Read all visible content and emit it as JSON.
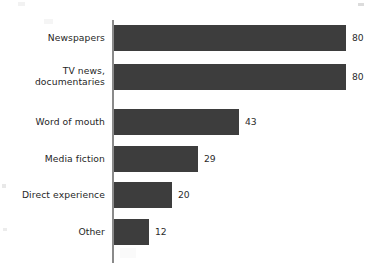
{
  "chart_data": {
    "type": "bar",
    "orientation": "horizontal",
    "title": "",
    "subtitle": "",
    "xlabel": "",
    "ylabel": "",
    "categories": [
      "Newspapers",
      "TV news,\ndocumentaries",
      "Word of mouth",
      "Media fiction",
      "Direct experience",
      "Other"
    ],
    "values": [
      80,
      80,
      43,
      29,
      20,
      12
    ],
    "value_labels": [
      "80",
      "80",
      "43",
      "29",
      "20",
      "12"
    ],
    "xlim": [
      0,
      80
    ],
    "grid": false,
    "legend": false,
    "bar_color": "#3d3d3d",
    "axis_color": "#8a8a8a",
    "background_color": "#ffffff",
    "label_color": "#262626",
    "bars": [
      {
        "label": "Newspapers",
        "value": 80,
        "value_label": "80",
        "lines": 1
      },
      {
        "label": "TV news,\ndocumentaries",
        "value": 80,
        "value_label": "80",
        "lines": 2
      },
      {
        "label": "Word of mouth",
        "value": 43,
        "value_label": "43",
        "lines": 1
      },
      {
        "label": "Media fiction",
        "value": 29,
        "value_label": "29",
        "lines": 1
      },
      {
        "label": "Direct experience",
        "value": 20,
        "value_label": "20",
        "lines": 1
      },
      {
        "label": "Other",
        "value": 12,
        "value_label": "12",
        "lines": 1
      }
    ]
  }
}
